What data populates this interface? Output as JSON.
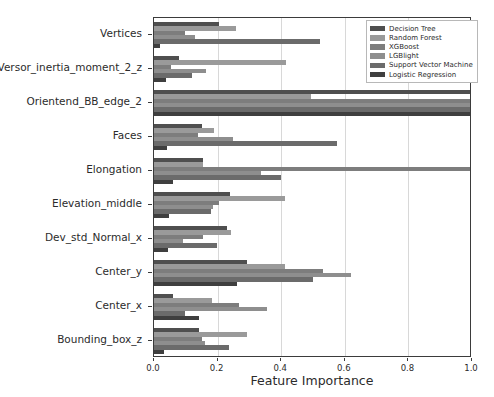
{
  "chart_data": {
    "type": "bar",
    "orientation": "horizontal",
    "title": "",
    "xlabel": "Feature Importance",
    "ylabel": "",
    "xlim": [
      0.0,
      1.0
    ],
    "xticks": [
      "0.0",
      "0.2",
      "0.4",
      "0.6",
      "0.8",
      "1.0"
    ],
    "xtick_values": [
      0.0,
      0.2,
      0.4,
      0.6,
      0.8,
      1.0
    ],
    "grid": "vertical",
    "legend_position": "upper right",
    "categories": [
      "Vertices",
      "Versor_inertia_moment_2_z",
      "Orientend_BB_edge_2",
      "Faces",
      "Elongation",
      "Elevation_middle",
      "Dev_std_Normal_x",
      "Center_y",
      "Center_x",
      "Bounding_box_z"
    ],
    "series": [
      {
        "name": "Decision Tree",
        "color": "#4f4f4f",
        "values": [
          0.205,
          0.078,
          1.0,
          0.152,
          0.155,
          0.238,
          0.228,
          0.292,
          0.06,
          0.14
        ]
      },
      {
        "name": "Random Forest",
        "color": "#9a9a9a",
        "values": [
          0.258,
          0.415,
          0.495,
          0.19,
          0.155,
          0.412,
          0.243,
          0.412,
          0.183,
          0.292
        ]
      },
      {
        "name": "XGBoost",
        "color": "#7d7d7d",
        "values": [
          0.097,
          0.055,
          1.0,
          0.138,
          1.0,
          0.205,
          0.155,
          0.533,
          0.268,
          0.152
        ]
      },
      {
        "name": "LGBlight",
        "color": "#8e8e8e",
        "values": [
          0.128,
          0.163,
          1.0,
          0.248,
          0.335,
          0.185,
          0.092,
          0.62,
          0.355,
          0.16
        ]
      },
      {
        "name": "Support Vector Machine",
        "color": "#6b6b6b",
        "values": [
          0.523,
          0.118,
          1.0,
          0.575,
          0.4,
          0.178,
          0.198,
          0.5,
          0.098,
          0.235
        ]
      },
      {
        "name": "Logistic Regression",
        "color": "#3f3f3f",
        "values": [
          0.02,
          0.038,
          1.0,
          0.04,
          0.06,
          0.048,
          0.045,
          0.262,
          0.143,
          0.03
        ]
      }
    ]
  },
  "legend": {
    "items": [
      {
        "label": "Decision Tree"
      },
      {
        "label": "Random Forest"
      },
      {
        "label": "XGBoost"
      },
      {
        "label": "LGBlight"
      },
      {
        "label": "Support Vector Machine"
      },
      {
        "label": "Logistic Regression"
      }
    ]
  }
}
